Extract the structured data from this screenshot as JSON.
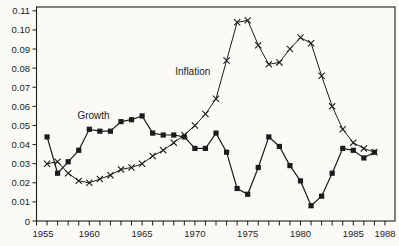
{
  "figure": {
    "background": "#fbfaf7",
    "ink": "#1c1c1c"
  },
  "chart_data": {
    "type": "line",
    "title": "",
    "xlabel": "",
    "ylabel": "",
    "grid": false,
    "legend": "inline-labels",
    "xlim": [
      1955,
      1988.95
    ],
    "ylim": [
      0,
      0.112
    ],
    "x_tick_step": 1,
    "x_labeled_ticks": [
      1955,
      1960,
      1965,
      1970,
      1975,
      1980,
      1985,
      1988
    ],
    "y_ticks": [
      0,
      0.01,
      0.02,
      0.03,
      0.04,
      0.05,
      0.06,
      0.07,
      0.08,
      0.09,
      0.1,
      0.11
    ],
    "x": [
      1956,
      1957,
      1958,
      1959,
      1960,
      1961,
      1962,
      1963,
      1964,
      1965,
      1966,
      1967,
      1968,
      1969,
      1970,
      1971,
      1972,
      1973,
      1974,
      1975,
      1976,
      1977,
      1978,
      1979,
      1980,
      1981,
      1982,
      1983,
      1984,
      1985,
      1986,
      1987
    ],
    "series": [
      {
        "name": "Growth",
        "marker": "square",
        "values": [
          0.044,
          0.025,
          0.031,
          0.037,
          0.048,
          0.047,
          0.047,
          0.052,
          0.053,
          0.055,
          0.046,
          0.045,
          0.045,
          0.044,
          0.038,
          0.038,
          0.046,
          0.036,
          0.017,
          0.014,
          0.028,
          0.044,
          0.039,
          0.029,
          0.021,
          0.008,
          0.013,
          0.025,
          0.038,
          0.037,
          0.033,
          0.036
        ]
      },
      {
        "name": "Inflation",
        "marker": "x",
        "values": [
          0.03,
          0.031,
          0.025,
          0.021,
          0.02,
          0.022,
          0.024,
          0.027,
          0.028,
          0.03,
          0.034,
          0.037,
          0.041,
          0.045,
          0.05,
          0.056,
          0.064,
          0.084,
          0.104,
          0.105,
          0.092,
          0.082,
          0.083,
          0.09,
          0.096,
          0.093,
          0.076,
          0.06,
          0.048,
          0.041,
          0.038,
          0.036
        ]
      }
    ],
    "annotations": [
      {
        "text": "Growth",
        "x": 1960.4,
        "y": 0.0552,
        "series": "Growth"
      },
      {
        "text": "Inflation",
        "x": 1969.8,
        "y": 0.0783,
        "series": "Inflation"
      }
    ]
  }
}
